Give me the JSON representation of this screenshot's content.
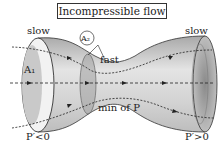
{
  "title": "Incompressible flow",
  "labels": {
    "slow_left": "slow",
    "slow_right": "slow",
    "fast": "fast",
    "a1": "A₁",
    "a2": "A₂",
    "min_p": "min of P",
    "p_left": "P′<0",
    "p_right": "P′>0"
  },
  "colors": {
    "tube_light": "#e6e6e6",
    "tube_dark": "#9a9a9a",
    "outline": "#333333",
    "text": "#222222"
  }
}
